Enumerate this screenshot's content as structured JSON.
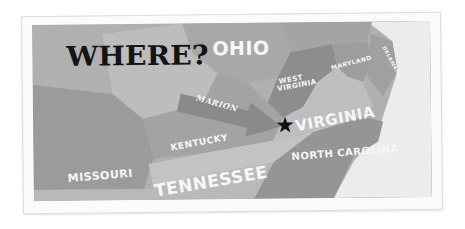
{
  "title": "WHERE?",
  "marker": {
    "icon": "star-icon",
    "glyph": "★",
    "location": "Marion, Virginia"
  },
  "arrow_label": "MARION",
  "states": [
    {
      "name": "OHIO"
    },
    {
      "name": "WEST VIRGINIA"
    },
    {
      "name": "MARYLAND"
    },
    {
      "name": "DELAWARE"
    },
    {
      "name": "VIRGINIA"
    },
    {
      "name": "KENTUCKY"
    },
    {
      "name": "MISSOURI"
    },
    {
      "name": "TENNESSEE"
    },
    {
      "name": "NORTH CAROLINA"
    }
  ],
  "colors": {
    "background": "#b3b3b3",
    "ohio": "#a9a9a9",
    "west_virginia": "#8e8e8e",
    "virginia": "#bdbdbd",
    "kentucky": "#a2a2a2",
    "tennessee": "#c2c2c2",
    "missouri": "#9a9a9a",
    "north_carolina": "#959595",
    "ocean": "#eeeeee",
    "arrow": "#8a8a8a",
    "title": "#141414",
    "label": "#f7f7f7"
  }
}
